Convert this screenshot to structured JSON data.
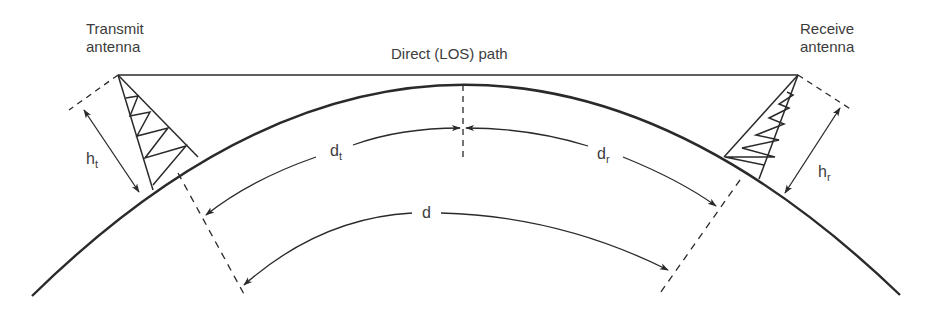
{
  "diagram": {
    "type": "line-of-sight radio propagation over curved earth",
    "labels": {
      "transmit_antenna": "Transmit\nantenna",
      "receive_antenna": "Receive\nantenna",
      "los_path": "Direct (LOS) path"
    },
    "symbols": {
      "ht_main": "h",
      "ht_sub": "t",
      "hr_main": "h",
      "hr_sub": "r",
      "dt_main": "d",
      "dt_sub": "t",
      "dr_main": "d",
      "dr_sub": "r",
      "d": "d"
    },
    "colors": {
      "line": "#2a2a2a",
      "text": "#3c3c3c",
      "background": "#ffffff"
    }
  }
}
